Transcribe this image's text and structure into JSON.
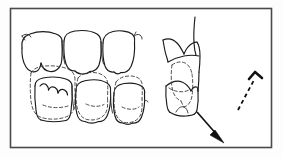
{
  "figure": {
    "background_color": "#ffffff",
    "ink_color": "#1a1a1a",
    "frame_color": "#4a4a4a",
    "ghost_color": "#3a3a3a",
    "arrow_color": "#111111",
    "width": 283,
    "height": 159,
    "has_text_labels": false
  },
  "frame": {
    "x": 10,
    "y": 8,
    "width": 262,
    "height": 140,
    "stroke_width": 1.6
  },
  "panels": [
    {
      "id": "occlusal-view",
      "name": "occlusal-tooth-rows",
      "label": "Occlusal view of upper and lower tooth rows",
      "teeth_upper_count": 3,
      "teeth_lower_count": 3,
      "ghost_outlines": 4
    },
    {
      "id": "buccal-view",
      "name": "buccal-tooth-profile",
      "label": "Lateral buccal profile of cusp interdigitation",
      "ghost_outlines": 2
    },
    {
      "id": "arrow-legend",
      "name": "dashed-direction-arrow",
      "label": "Dashed arrow indicating displacement path"
    }
  ],
  "arrows": [
    {
      "id": "solid-arrow",
      "name": "displacement-arrow-solid",
      "style": "solid",
      "from_x": 196,
      "from_y": 110,
      "to_x": 224,
      "to_y": 142,
      "direction": "down-right"
    },
    {
      "id": "dashed-arrow",
      "name": "displacement-arrow-dashed",
      "style": "dashed",
      "from_x": 238,
      "from_y": 108,
      "to_x": 259,
      "to_y": 74,
      "direction": "up-right"
    }
  ]
}
